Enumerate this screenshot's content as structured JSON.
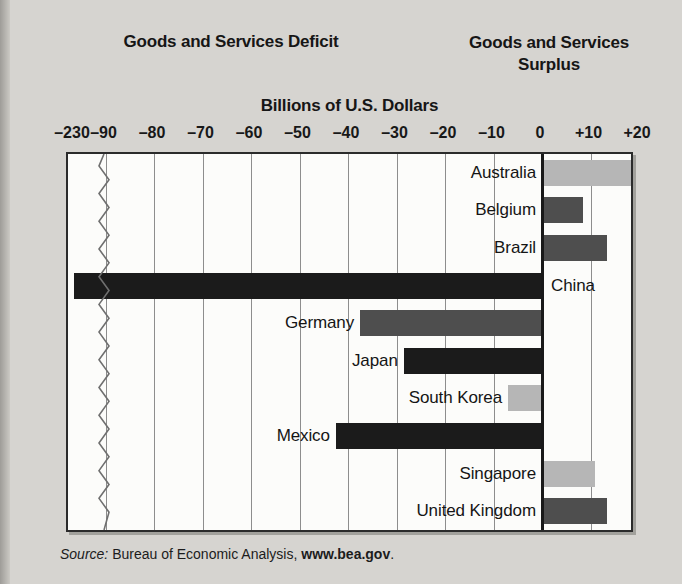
{
  "headings": {
    "deficit": "Goods and Services Deficit",
    "surplus_line1": "Goods and Services",
    "surplus_line2": "Surplus"
  },
  "source": {
    "prefix": "Source:",
    "body": " Bureau of Economic Analysis, ",
    "site": "www.bea.gov",
    "suffix": "."
  },
  "colors": {
    "black_bar": "#1b1b1b",
    "dark_gray_bar": "#4e4e4e",
    "light_gray_bar": "#b6b6b6",
    "plot_background": "#fcfcfa",
    "page_background": "#d6d4d0",
    "gridline": "#8d8d8d",
    "zero_line": "#191919"
  },
  "bleed_text": {
    "l1": "A temporary deficit in its payment",
    "l2": "nation manages its debt. If a natio",
    "l3": "to take on more debt and its paym",
    "l4": "Official Payments Deficits",
    "l5": "and Payment Surpluses",
    "l6": "for a period of years, it accumulates",
    "l7": "increasingly large share of its income"
  },
  "chart_data": {
    "type": "bar",
    "orientation": "horizontal",
    "title": "Billions of U.S. Dollars",
    "xlabel": "Billions of U.S. Dollars",
    "ylabel": "",
    "grid": true,
    "legend": false,
    "axis_break": {
      "present": true,
      "between": [
        -230,
        -90
      ],
      "note": "zigzag break mark near left edge of plot"
    },
    "tick_labels": [
      "–230",
      "–90",
      "–80",
      "–70",
      "–60",
      "–50",
      "–40",
      "–30",
      "–20",
      "–10",
      "0",
      "+10",
      "+20"
    ],
    "tick_values": [
      -230,
      -90,
      -80,
      -70,
      -60,
      -50,
      -40,
      -30,
      -20,
      -10,
      0,
      10,
      20
    ],
    "xlim": [
      -95,
      22
    ],
    "categories": [
      "Australia",
      "Belgium",
      "Brazil",
      "China",
      "Germany",
      "Japan",
      "South Korea",
      "Mexico",
      "Singapore",
      "United Kingdom"
    ],
    "values": [
      19.5,
      8.5,
      13.5,
      -230,
      -37.5,
      -28.5,
      -7,
      -42.5,
      11,
      13.5
    ],
    "bars": [
      {
        "label": "Australia",
        "value": 19.5,
        "shade": "light",
        "side": "surplus",
        "label_side": "left"
      },
      {
        "label": "Belgium",
        "value": 8.5,
        "shade": "dark",
        "side": "surplus",
        "label_side": "left"
      },
      {
        "label": "Brazil",
        "value": 13.5,
        "shade": "dark",
        "side": "surplus",
        "label_side": "left"
      },
      {
        "label": "China",
        "value": -230,
        "shade": "black",
        "side": "deficit",
        "label_side": "right"
      },
      {
        "label": "Germany",
        "value": -37.5,
        "shade": "dark",
        "side": "deficit",
        "label_side": "left"
      },
      {
        "label": "Japan",
        "value": -28.5,
        "shade": "black",
        "side": "deficit",
        "label_side": "left"
      },
      {
        "label": "South Korea",
        "value": -7,
        "shade": "light",
        "side": "deficit",
        "label_side": "left"
      },
      {
        "label": "Mexico",
        "value": -42.5,
        "shade": "black",
        "side": "deficit",
        "label_side": "left"
      },
      {
        "label": "Singapore",
        "value": 11,
        "shade": "light",
        "side": "surplus",
        "label_side": "left"
      },
      {
        "label": "United Kingdom",
        "value": 13.5,
        "shade": "dark",
        "side": "surplus",
        "label_side": "left"
      }
    ]
  }
}
